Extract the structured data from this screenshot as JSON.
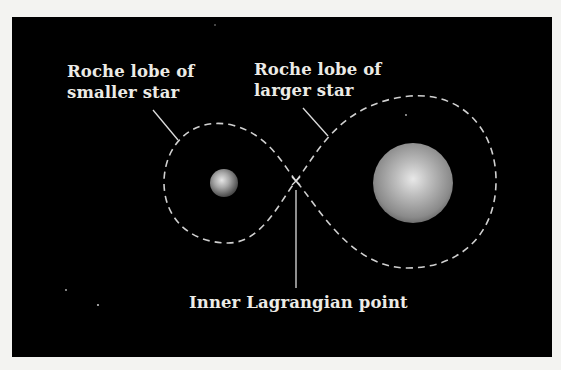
{
  "figure": {
    "background_color": "#000000",
    "page_color": "#f3f3f1",
    "line_color": "#d8d8d8",
    "labels": {
      "smaller_lobe": {
        "line1": "Roche lobe of",
        "line2": "smaller star"
      },
      "larger_lobe": {
        "line1": "Roche lobe of",
        "line2": "larger star"
      },
      "lagrangian": {
        "text": "Inner Lagrangian point"
      }
    },
    "elements": {
      "smaller_star": {
        "name": "smaller star",
        "cx": 224,
        "cy": 183,
        "r": 14
      },
      "larger_star": {
        "name": "larger star",
        "cx": 413,
        "cy": 183,
        "r": 40
      },
      "inner_lagrangian_point": {
        "x": 296,
        "y": 181
      }
    }
  }
}
